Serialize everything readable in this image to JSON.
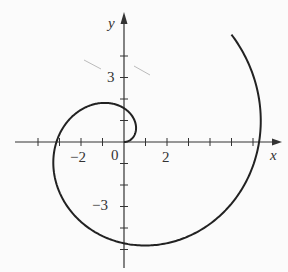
{
  "chart_data": {
    "type": "line",
    "title": "",
    "equation": "r = θ",
    "theta_range": [
      0,
      7.0686
    ],
    "xlabel": "x",
    "ylabel": "y",
    "x_tick_labels": [
      {
        "value": -2,
        "label": "−2"
      },
      {
        "value": 0,
        "label": "0"
      },
      {
        "value": 2,
        "label": "2"
      }
    ],
    "y_tick_labels": [
      {
        "value": 3,
        "label": "3"
      },
      {
        "value": -3,
        "label": "−3"
      }
    ],
    "xlim": [
      -5,
      7
    ],
    "ylim": [
      -6,
      6
    ],
    "grid": false,
    "series": [
      {
        "name": "spiral",
        "points_desc": "Archimedean spiral r=θ, from origin through (0,1.57), (-3.14,0), (0,-4.71), (6.28,0) to (5,5)"
      }
    ],
    "origin_px": [
      124,
      142
    ],
    "unit_px": 21.5
  },
  "labels": {
    "x_axis": "x",
    "y_axis": "y",
    "tick_neg2": "−2",
    "tick_0": "0",
    "tick_2": "2",
    "tick_3": "3",
    "tick_neg3": "−3"
  }
}
